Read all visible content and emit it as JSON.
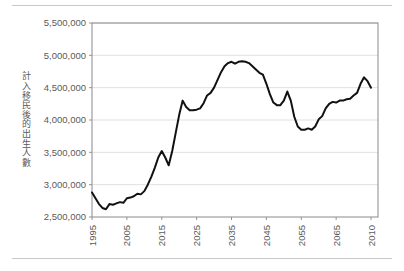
{
  "page": {
    "background_color": "#ffffff",
    "rule_color": "#c9c9c9"
  },
  "chart_data": {
    "type": "line",
    "title": "",
    "subtitle": "",
    "xlabel": "",
    "ylabel": "計入移民後的出生人數",
    "ylim": [
      2500000,
      5500000
    ],
    "ytick_labels": [
      "2,500,000",
      "3,000,000",
      "3,500,000",
      "4,000,000",
      "4,500,000",
      "5,000,000",
      "5,500,000"
    ],
    "ytick_values": [
      2500000,
      3000000,
      3500000,
      4000000,
      4500000,
      5000000,
      5500000
    ],
    "xtick_labels": [
      "1995",
      "2005",
      "2015",
      "2025",
      "2035",
      "2045",
      "2055",
      "2065",
      "2010"
    ],
    "xtick_positions": [
      0,
      10,
      20,
      30,
      40,
      50,
      60,
      70,
      80
    ],
    "xlim": [
      0,
      82
    ],
    "grid": true,
    "legend": null,
    "line_color": "#111111",
    "line_width": 2,
    "series": [
      {
        "name": "計入移民後的出生人數",
        "x": [
          0,
          1,
          2,
          3,
          4,
          5,
          6,
          7,
          8,
          9,
          10,
          11,
          12,
          13,
          14,
          15,
          16,
          17,
          18,
          19,
          20,
          21,
          22,
          23,
          24,
          25,
          26,
          27,
          28,
          29,
          30,
          31,
          32,
          33,
          34,
          35,
          36,
          37,
          38,
          39,
          40,
          41,
          42,
          43,
          44,
          45,
          46,
          47,
          48,
          49,
          50,
          51,
          52,
          53,
          54,
          55,
          56,
          57,
          58,
          59,
          60,
          61,
          62,
          63,
          64,
          65,
          66,
          67,
          68,
          69,
          70,
          71,
          72,
          73,
          74,
          75,
          76,
          77,
          78,
          79,
          80
        ],
        "values": [
          2880000,
          2790000,
          2700000,
          2640000,
          2620000,
          2700000,
          2690000,
          2710000,
          2730000,
          2720000,
          2790000,
          2800000,
          2820000,
          2860000,
          2850000,
          2900000,
          3000000,
          3120000,
          3260000,
          3420000,
          3520000,
          3420000,
          3300000,
          3520000,
          3800000,
          4080000,
          4300000,
          4200000,
          4150000,
          4150000,
          4160000,
          4180000,
          4260000,
          4380000,
          4420000,
          4500000,
          4620000,
          4740000,
          4830000,
          4880000,
          4900000,
          4870000,
          4900000,
          4910000,
          4900000,
          4880000,
          4830000,
          4780000,
          4730000,
          4700000,
          4560000,
          4400000,
          4270000,
          4230000,
          4230000,
          4300000,
          4440000,
          4300000,
          4050000,
          3900000,
          3850000,
          3850000,
          3870000,
          3850000,
          3900000,
          4010000,
          4060000,
          4180000,
          4250000,
          4280000,
          4270000,
          4300000,
          4300000,
          4320000,
          4330000,
          4380000,
          4420000,
          4560000,
          4660000,
          4600000,
          4500000
        ]
      }
    ],
    "annotations": []
  }
}
